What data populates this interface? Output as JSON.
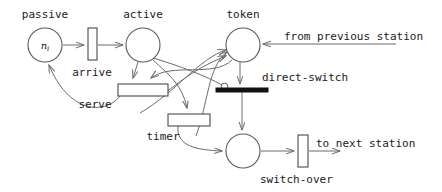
{
  "diagram": {
    "type": "petri-net",
    "places": [
      {
        "id": "passive",
        "label": "passive",
        "marking": "n",
        "marking_sub": "i",
        "cx": 45,
        "cy": 45,
        "r": 17
      },
      {
        "id": "active",
        "label": "active",
        "marking": "",
        "marking_sub": "",
        "cx": 143,
        "cy": 45,
        "r": 17
      },
      {
        "id": "token",
        "label": "token",
        "marking": "",
        "marking_sub": "",
        "cx": 243,
        "cy": 45,
        "r": 17
      },
      {
        "id": "queue",
        "label": "",
        "marking": "",
        "marking_sub": "",
        "cx": 243,
        "cy": 151,
        "r": 17
      }
    ],
    "transitions": [
      {
        "id": "arrive",
        "label": "arrive",
        "shape": "vertical-bar",
        "x": 88,
        "y": 28,
        "w": 9,
        "h": 32
      },
      {
        "id": "serve",
        "label": "serve",
        "shape": "horizontal-box",
        "x": 118,
        "y": 84,
        "w": 50,
        "h": 12
      },
      {
        "id": "timer",
        "label": "timer",
        "shape": "horizontal-box",
        "x": 168,
        "y": 114,
        "w": 42,
        "h": 12
      },
      {
        "id": "direct-switch",
        "label": "direct-switch",
        "shape": "solid-bar",
        "x": 216,
        "y": 88,
        "w": 52,
        "h": 4
      },
      {
        "id": "switch-over",
        "label": "switch-over",
        "shape": "vertical-bar",
        "x": 298,
        "y": 135,
        "w": 10,
        "h": 32
      }
    ],
    "annotations": [
      {
        "id": "from-previous-station",
        "text": "from previous station"
      },
      {
        "id": "to-next-station",
        "text": "to next station"
      }
    ],
    "colors": {
      "stroke": "#6b6b6b",
      "node_stroke": "#5a5a5a",
      "solid_fill": "#111111",
      "text": "#1a1a1a",
      "background": "#ffffff"
    }
  }
}
